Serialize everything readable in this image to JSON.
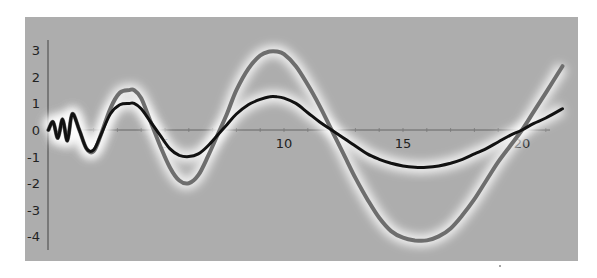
{
  "chart_data": {
    "type": "line",
    "title": "",
    "xlabel": "",
    "ylabel": "",
    "xlim": [
      0,
      21.7
    ],
    "ylim": [
      -4.5,
      3.5
    ],
    "grid": false,
    "legend": null,
    "x_ticks": [
      5,
      10,
      15,
      20
    ],
    "x_tick_labels": [
      "5",
      "10",
      "15",
      "20"
    ],
    "y_ticks": [
      3,
      2,
      1,
      0,
      -1,
      -2,
      -3,
      -4
    ],
    "y_tick_labels": [
      "3",
      "2",
      "1",
      "0",
      "-1",
      "-2",
      "-3",
      "-4"
    ],
    "series": [
      {
        "name": "gray-curve",
        "color": "#6e6e6e",
        "glow": true,
        "x": [
          0.1,
          0.3,
          0.5,
          0.7,
          0.9,
          1.1,
          1.4,
          1.7,
          2.0,
          2.3,
          2.7,
          3.1,
          3.5,
          3.7,
          4.0,
          4.4,
          4.8,
          5.2,
          5.6,
          6.0,
          6.4,
          6.8,
          7.2,
          7.6,
          8.0,
          8.5,
          9.0,
          9.4,
          9.7,
          10.0,
          10.5,
          11.0,
          11.5,
          12.0,
          12.5,
          13.0,
          13.5,
          14.0,
          14.5,
          15.0,
          15.5,
          16.0,
          16.5,
          17.0,
          17.5,
          18.0,
          18.5,
          19.0,
          19.5,
          20.0,
          20.5,
          21.0,
          21.7
        ],
        "values": [
          0.0,
          0.3,
          -0.3,
          0.4,
          -0.4,
          0.6,
          0.0,
          -0.7,
          -0.8,
          -0.2,
          0.8,
          1.4,
          1.5,
          1.5,
          1.2,
          0.3,
          -0.6,
          -1.4,
          -1.9,
          -2.0,
          -1.7,
          -1.0,
          -0.2,
          0.6,
          1.5,
          2.3,
          2.8,
          2.95,
          2.95,
          2.85,
          2.4,
          1.7,
          0.9,
          0.0,
          -0.9,
          -1.8,
          -2.6,
          -3.3,
          -3.8,
          -4.05,
          -4.15,
          -4.15,
          -4.0,
          -3.7,
          -3.2,
          -2.6,
          -1.9,
          -1.2,
          -0.6,
          0.0,
          0.7,
          1.4,
          2.4
        ]
      },
      {
        "name": "black-curve",
        "color": "#111111",
        "glow": true,
        "x": [
          0.1,
          0.3,
          0.5,
          0.7,
          0.9,
          1.1,
          1.4,
          1.7,
          2.0,
          2.3,
          2.7,
          3.1,
          3.5,
          3.7,
          4.0,
          4.4,
          4.8,
          5.2,
          5.6,
          6.0,
          6.4,
          6.8,
          7.2,
          7.6,
          8.0,
          8.5,
          9.0,
          9.4,
          9.7,
          10.0,
          10.5,
          11.0,
          11.5,
          12.0,
          12.5,
          13.0,
          13.5,
          14.0,
          14.5,
          15.0,
          15.5,
          16.0,
          16.5,
          17.0,
          17.5,
          18.0,
          18.5,
          19.0,
          19.5,
          20.0,
          20.5,
          21.0,
          21.7
        ],
        "values": [
          0.0,
          0.3,
          -0.3,
          0.4,
          -0.4,
          0.6,
          0.0,
          -0.7,
          -0.75,
          -0.2,
          0.6,
          0.95,
          1.0,
          1.0,
          0.8,
          0.3,
          -0.2,
          -0.7,
          -0.95,
          -1.0,
          -0.9,
          -0.6,
          -0.2,
          0.2,
          0.6,
          0.95,
          1.15,
          1.25,
          1.25,
          1.2,
          1.0,
          0.65,
          0.3,
          0.0,
          -0.3,
          -0.6,
          -0.9,
          -1.1,
          -1.25,
          -1.35,
          -1.4,
          -1.4,
          -1.35,
          -1.25,
          -1.1,
          -0.9,
          -0.7,
          -0.45,
          -0.2,
          0.0,
          0.25,
          0.45,
          0.8
        ]
      }
    ]
  },
  "layout": {
    "x0_px": 46,
    "px_per_x": 23.8,
    "y0_px": 130,
    "px_per_y": 26.6,
    "frame_left": 25,
    "frame_top": 17
  }
}
